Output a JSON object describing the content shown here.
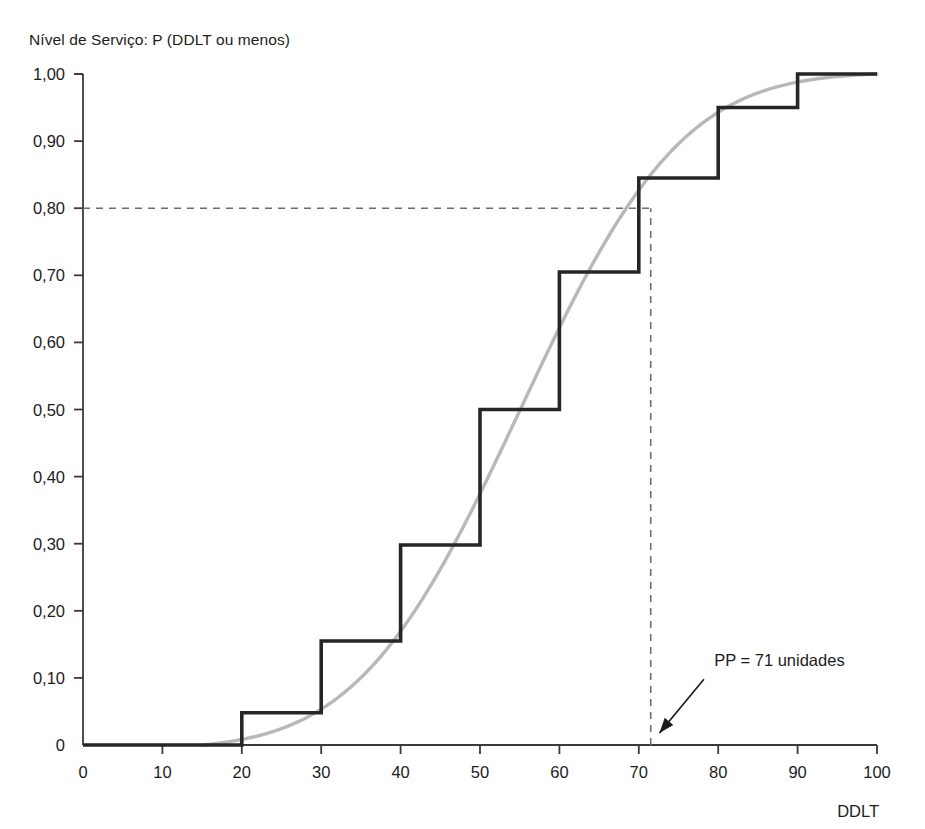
{
  "figure": {
    "top_cut_text": "",
    "y_axis_title": "Nível de Serviço: P (DDLT ou menos)",
    "x_axis_title": "DDLT"
  },
  "chart_data": {
    "type": "line",
    "title": "Nível de Serviço: P (DDLT ou menos)",
    "xlabel": "DDLT",
    "ylabel": "Nível de Serviço: P (DDLT ou menos)",
    "xlim": [
      0,
      100
    ],
    "ylim": [
      0,
      1.0
    ],
    "grid": false,
    "legend": "none",
    "x_ticks": [
      0,
      10,
      20,
      30,
      40,
      50,
      60,
      70,
      80,
      90,
      100
    ],
    "x_tick_labels": [
      "0",
      "10",
      "20",
      "30",
      "40",
      "50",
      "60",
      "70",
      "80",
      "90",
      "100"
    ],
    "y_ticks": [
      0,
      0.1,
      0.2,
      0.3,
      0.4,
      0.5,
      0.6,
      0.7,
      0.8,
      0.9,
      1.0
    ],
    "y_tick_labels": [
      "0",
      "0,10",
      "0,20",
      "0,30",
      "0,40",
      "0,50",
      "0,60",
      "0,70",
      "0,80",
      "0,90",
      "1,00"
    ],
    "series": [
      {
        "name": "empirical-cdf-step",
        "style": "step",
        "color": "#262626",
        "width": 3.6,
        "points": [
          {
            "x": 0,
            "y": 0
          },
          {
            "x": 20,
            "y": 0
          },
          {
            "x": 20,
            "y": 0.048
          },
          {
            "x": 30,
            "y": 0.048
          },
          {
            "x": 30,
            "y": 0.155
          },
          {
            "x": 40,
            "y": 0.155
          },
          {
            "x": 40,
            "y": 0.298
          },
          {
            "x": 50,
            "y": 0.298
          },
          {
            "x": 50,
            "y": 0.5
          },
          {
            "x": 60,
            "y": 0.5
          },
          {
            "x": 60,
            "y": 0.705
          },
          {
            "x": 70,
            "y": 0.705
          },
          {
            "x": 70,
            "y": 0.845
          },
          {
            "x": 80,
            "y": 0.845
          },
          {
            "x": 80,
            "y": 0.95
          },
          {
            "x": 90,
            "y": 0.95
          },
          {
            "x": 90,
            "y": 1.0
          },
          {
            "x": 100,
            "y": 1.0
          }
        ]
      },
      {
        "name": "normal-cdf-smooth",
        "style": "smooth",
        "color": "#b8b8b8",
        "width": 3.4,
        "mean": 55,
        "sigma": 16,
        "x_start": 15,
        "x_end": 100
      }
    ],
    "reference_lines": [
      {
        "name": "service-level-line",
        "orientation": "horizontal",
        "value": 0.8,
        "x_from": 0,
        "x_to": 71.5,
        "dash": "7,6",
        "color": "#6e6e6e"
      },
      {
        "name": "reorder-point-line",
        "orientation": "vertical",
        "value": 71.5,
        "y_from": 0,
        "y_to": 0.8,
        "dash": "7,6",
        "color": "#6e6e6e"
      }
    ],
    "annotations": [
      {
        "name": "reorder-point-annotation",
        "text": "PP = 71 unidades",
        "text_x": 79.5,
        "text_y": 0.118,
        "arrow_from_x": 78.2,
        "arrow_from_y": 0.098,
        "arrow_to_x": 72.6,
        "arrow_to_y": 0.018
      }
    ]
  }
}
